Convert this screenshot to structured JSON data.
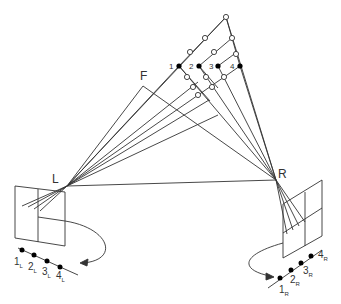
{
  "labels": {
    "F": "F",
    "L": "L",
    "R": "R",
    "points": [
      "1",
      "2",
      "3",
      "4"
    ],
    "left_points": [
      {
        "num": "1",
        "sub": "L"
      },
      {
        "num": "2",
        "sub": "L"
      },
      {
        "num": "3",
        "sub": "L"
      },
      {
        "num": "4",
        "sub": "L"
      }
    ],
    "right_points": [
      {
        "num": "1",
        "sub": "R"
      },
      {
        "num": "2",
        "sub": "R"
      },
      {
        "num": "3",
        "sub": "R"
      },
      {
        "num": "4",
        "sub": "R"
      }
    ]
  },
  "colors": {
    "stroke": "#333333",
    "fill": "#000000",
    "bg": "#ffffff"
  }
}
